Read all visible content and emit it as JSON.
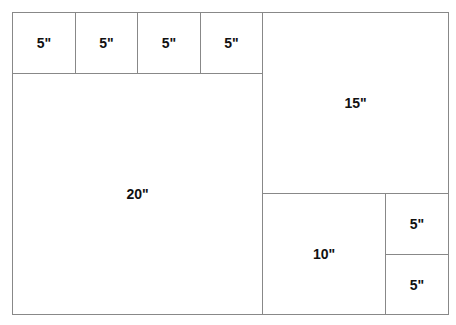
{
  "cells": {
    "a": "5\"",
    "b": "5\"",
    "c": "5\"",
    "d": "5\"",
    "big": "20\"",
    "r15": "15\"",
    "r10": "10\"",
    "s1": "5\"",
    "s2": "5\""
  }
}
